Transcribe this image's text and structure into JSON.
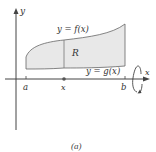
{
  "figure": {
    "caption": "(a)",
    "axes": {
      "x_label": "x",
      "y_label": "y"
    },
    "curves": {
      "upper": "y = f(x)",
      "lower": "y = g(x)"
    },
    "region_label": "R",
    "ticks": {
      "a": "a",
      "x": "x",
      "b": "b"
    },
    "rotation_indicator": "rotation-about-x-axis",
    "colors": {
      "region_fill": "#e8e8e8",
      "stroke": "#555555",
      "axis": "#444444",
      "text": "#333333"
    }
  }
}
